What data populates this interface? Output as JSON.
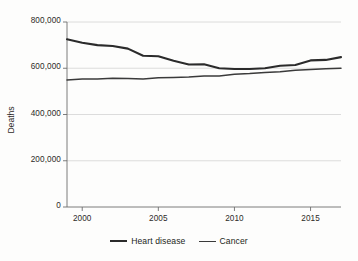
{
  "chart_data": {
    "type": "line",
    "title": "",
    "subtitle": "",
    "xlabel": "",
    "ylabel": "Deaths",
    "xlim": [
      1999,
      2017
    ],
    "ylim": [
      0,
      800000
    ],
    "grid": true,
    "legend_position": "bottom-center",
    "x_ticks": [
      2000,
      2005,
      2010,
      2015
    ],
    "x_tick_labels": [
      "2000",
      "2005",
      "2010",
      "2015"
    ],
    "y_ticks": [
      0,
      200000,
      400000,
      600000,
      800000
    ],
    "y_tick_labels": [
      "0",
      "200,000",
      "400,000",
      "600,000",
      "800,000"
    ],
    "x": [
      1999,
      2000,
      2001,
      2002,
      2003,
      2004,
      2005,
      2006,
      2007,
      2008,
      2009,
      2010,
      2011,
      2012,
      2013,
      2014,
      2015,
      2016,
      2017
    ],
    "series": [
      {
        "name": "Heart disease",
        "color": "#2b2b2b",
        "width": 2.1,
        "values": [
          725000,
          710000,
          700000,
          696000,
          685000,
          654000,
          652000,
          632000,
          616000,
          617000,
          600000,
          597000,
          597000,
          600000,
          611000,
          614000,
          634000,
          636000,
          648000
        ]
      },
      {
        "name": "Cancer",
        "color": "#3a3a3a",
        "width": 1.5,
        "values": [
          549000,
          553000,
          554000,
          557000,
          556000,
          554000,
          559000,
          560000,
          562000,
          566000,
          567000,
          574000,
          577000,
          582000,
          585000,
          591000,
          595000,
          598000,
          600000
        ]
      }
    ]
  },
  "legend": {
    "items": [
      {
        "label": "Heart disease"
      },
      {
        "label": "Cancer"
      }
    ]
  },
  "axes": {
    "y_axis_title": "Deaths"
  }
}
